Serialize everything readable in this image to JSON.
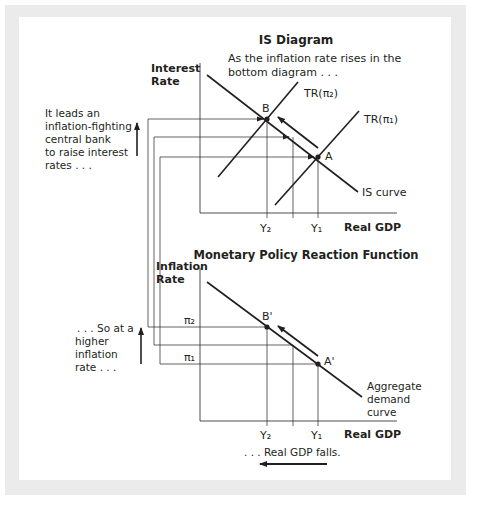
{
  "top_diagram": {
    "title": "IS Diagram",
    "annotation_line1": "As the inflation rate rises in the",
    "annotation_line2": "bottom diagram . . .",
    "y_axis_label_line1": "Interest",
    "y_axis_label_line2": "Rate",
    "x_axis_label": "Real GDP",
    "curves": {
      "is_curve": "IS curve",
      "tr_pi2": "TR(π₂)",
      "tr_pi1": "TR(π₁)"
    },
    "points": {
      "b": "B",
      "a": "A"
    },
    "x_ticks": {
      "y2": "Y₂",
      "y1": "Y₁"
    },
    "side_note": [
      "It leads an",
      "inflation-fighting",
      "central bank",
      "to raise interest",
      "rates . . ."
    ]
  },
  "bottom_diagram": {
    "title": "Monetary Policy Reaction Function",
    "y_axis_label_line1": "Inflation",
    "y_axis_label_line2": "Rate",
    "x_axis_label": "Real GDP",
    "y_ticks": {
      "pi2": "π₂",
      "pi1": "π₁"
    },
    "points": {
      "b_prime": "B'",
      "a_prime": "A'"
    },
    "curve_label": [
      "Aggregate",
      "demand",
      "curve"
    ],
    "x_ticks": {
      "y2": "Y₂",
      "y1": "Y₁"
    },
    "side_note": [
      ". . . So at a",
      "higher",
      "inflation",
      "rate . . ."
    ],
    "bottom_note": ". . . Real GDP falls."
  },
  "colors": {
    "line": "#231f20",
    "frame": "#ebebeb",
    "background": "#ffffff"
  }
}
